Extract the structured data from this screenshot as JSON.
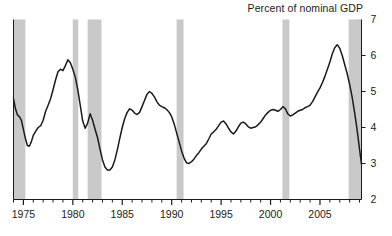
{
  "chart_data": {
    "type": "line",
    "title": "Percent of nominal GDP",
    "xlabel": "",
    "ylabel": "",
    "xlim": [
      1974.0,
      2009.2
    ],
    "ylim": [
      2,
      7
    ],
    "yticks": [
      2,
      3,
      4,
      5,
      6,
      7
    ],
    "ytick_labels": [
      "2",
      "3",
      "4",
      "5",
      "6",
      "7"
    ],
    "xticks": [
      1975,
      1980,
      1985,
      1990,
      1995,
      2000,
      2005
    ],
    "xtick_labels": [
      "1975",
      "1980",
      "1985",
      "1990",
      "1995",
      "2000",
      "2005"
    ],
    "minor_xtick_interval": 1,
    "grid": false,
    "legend": null,
    "axis_positions": {
      "ylabels": "right",
      "xlabels": "bottom"
    },
    "line_color": "#1a1a1a",
    "shade_color": "#c9c9c9",
    "shaded_regions": [
      {
        "label": "recession-1973-1975",
        "start": 1974.0,
        "end": 1975.2
      },
      {
        "label": "recession-1980",
        "start": 1980.0,
        "end": 1980.55
      },
      {
        "label": "recession-1981-1982",
        "start": 1981.5,
        "end": 1982.9
      },
      {
        "label": "recession-1990-1991",
        "start": 1990.5,
        "end": 1991.2
      },
      {
        "label": "recession-2001",
        "start": 2001.2,
        "end": 2001.9
      },
      {
        "label": "recession-2007-2009",
        "start": 2007.9,
        "end": 2009.2
      },
      {
        "label": "shade-right-edge",
        "start": 2008.6,
        "end": 2009.2
      }
    ],
    "x": [
      1974.0,
      1974.2,
      1974.4,
      1974.6,
      1974.8,
      1975.0,
      1975.2,
      1975.4,
      1975.6,
      1975.8,
      1976.0,
      1976.25,
      1976.5,
      1976.75,
      1977.0,
      1977.25,
      1977.5,
      1977.75,
      1978.0,
      1978.25,
      1978.5,
      1978.75,
      1979.0,
      1979.25,
      1979.5,
      1979.75,
      1980.0,
      1980.25,
      1980.5,
      1980.75,
      1981.0,
      1981.25,
      1981.5,
      1981.75,
      1982.0,
      1982.25,
      1982.5,
      1982.75,
      1983.0,
      1983.25,
      1983.5,
      1983.75,
      1984.0,
      1984.25,
      1984.5,
      1984.75,
      1985.0,
      1985.25,
      1985.5,
      1985.75,
      1986.0,
      1986.25,
      1986.5,
      1986.75,
      1987.0,
      1987.25,
      1987.5,
      1987.75,
      1988.0,
      1988.25,
      1988.5,
      1988.75,
      1989.0,
      1989.25,
      1989.5,
      1989.75,
      1990.0,
      1990.25,
      1990.5,
      1990.75,
      1991.0,
      1991.25,
      1991.5,
      1991.75,
      1992.0,
      1992.25,
      1992.5,
      1992.75,
      1993.0,
      1993.25,
      1993.5,
      1993.75,
      1994.0,
      1994.25,
      1994.5,
      1994.75,
      1995.0,
      1995.25,
      1995.5,
      1995.75,
      1996.0,
      1996.25,
      1996.5,
      1996.75,
      1997.0,
      1997.25,
      1997.5,
      1997.75,
      1998.0,
      1998.25,
      1998.5,
      1998.75,
      1999.0,
      1999.25,
      1999.5,
      1999.75,
      2000.0,
      2000.25,
      2000.5,
      2000.75,
      2001.0,
      2001.25,
      2001.5,
      2001.75,
      2002.0,
      2002.25,
      2002.5,
      2002.75,
      2003.0,
      2003.25,
      2003.5,
      2003.75,
      2004.0,
      2004.25,
      2004.5,
      2004.75,
      2005.0,
      2005.25,
      2005.5,
      2005.75,
      2006.0,
      2006.25,
      2006.5,
      2006.75,
      2007.0,
      2007.25,
      2007.5,
      2007.75,
      2008.0,
      2008.25,
      2008.5,
      2008.75,
      2009.0,
      2009.2
    ],
    "y": [
      4.8,
      4.52,
      4.35,
      4.3,
      4.2,
      3.95,
      3.7,
      3.5,
      3.48,
      3.6,
      3.78,
      3.9,
      4.0,
      4.05,
      4.2,
      4.45,
      4.62,
      4.8,
      5.05,
      5.32,
      5.55,
      5.62,
      5.58,
      5.72,
      5.88,
      5.8,
      5.62,
      5.4,
      5.05,
      4.62,
      4.18,
      3.98,
      4.12,
      4.38,
      4.2,
      3.95,
      3.72,
      3.4,
      3.1,
      2.9,
      2.82,
      2.82,
      2.9,
      3.1,
      3.38,
      3.7,
      4.0,
      4.25,
      4.42,
      4.52,
      4.48,
      4.4,
      4.36,
      4.42,
      4.58,
      4.75,
      4.92,
      5.0,
      4.95,
      4.85,
      4.72,
      4.62,
      4.58,
      4.55,
      4.5,
      4.42,
      4.3,
      4.1,
      3.85,
      3.6,
      3.35,
      3.15,
      3.02,
      3.0,
      3.05,
      3.12,
      3.22,
      3.3,
      3.4,
      3.48,
      3.55,
      3.68,
      3.82,
      3.88,
      3.95,
      4.05,
      4.15,
      4.18,
      4.1,
      3.98,
      3.88,
      3.82,
      3.9,
      4.02,
      4.12,
      4.15,
      4.1,
      4.02,
      3.98,
      4.0,
      4.02,
      4.08,
      4.15,
      4.25,
      4.35,
      4.42,
      4.48,
      4.5,
      4.48,
      4.45,
      4.5,
      4.58,
      4.52,
      4.38,
      4.32,
      4.35,
      4.4,
      4.45,
      4.48,
      4.5,
      4.55,
      4.58,
      4.62,
      4.72,
      4.85,
      4.98,
      5.1,
      5.25,
      5.42,
      5.62,
      5.82,
      6.05,
      6.22,
      6.3,
      6.2,
      6.0,
      5.75,
      5.5,
      5.2,
      4.85,
      4.42,
      3.95,
      3.4,
      2.98
    ]
  }
}
